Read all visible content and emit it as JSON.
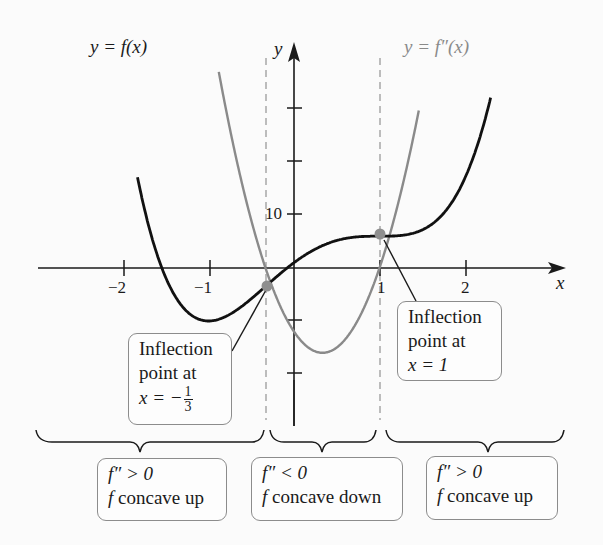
{
  "chart_data": {
    "type": "line",
    "title": "",
    "xlabel": "x",
    "ylabel": "y",
    "xlim": [
      -2.5,
      3.0
    ],
    "ylim": [
      -20,
      30
    ],
    "grid": false,
    "x_ticks": [
      -2,
      -1,
      1,
      2
    ],
    "x_tick_labels": [
      "−2",
      "−1",
      "1",
      "2"
    ],
    "y_ticks": [
      -20,
      -10,
      10,
      20,
      30
    ],
    "y_tick_labels": [
      "",
      "",
      "10",
      "",
      ""
    ],
    "series": [
      {
        "name": "y = f(x)",
        "formula": "3x^4 - 4x^3 - 6x^2 + 12x + 1",
        "color": "#111111",
        "x": [
          -1.75,
          -1.5,
          -1.25,
          -1.0,
          -0.75,
          -0.5,
          -0.333,
          0.0,
          0.25,
          0.5,
          0.75,
          1.0,
          1.25,
          1.5,
          1.75,
          2.0,
          2.3
        ],
        "values": [
          22.6,
          2.7,
          -6.6,
          -10.0,
          -9.5,
          -6.8,
          -4.4,
          1.0,
          3.6,
          5.3,
          6.1,
          6.0,
          6.2,
          7.7,
          12.0,
          17.0,
          30.0
        ]
      },
      {
        "name": "y = f''(x)",
        "formula": "36x^2 - 24x - 12",
        "color": "#8a8a8a",
        "x": [
          -0.85,
          -0.75,
          -0.5,
          -0.333,
          0.0,
          0.333,
          0.5,
          0.75,
          1.0,
          1.25,
          1.45
        ],
        "values": [
          34.4,
          26.3,
          9.0,
          0.0,
          -12.0,
          -16.0,
          -15.0,
          -9.75,
          0.0,
          14.25,
          28.9
        ]
      }
    ],
    "inflection_points": [
      {
        "x": -0.333,
        "y": -4.4,
        "label_lines": [
          "Inflection",
          "point at",
          "x = −"
        ],
        "fraction": {
          "num": "1",
          "den": "3"
        }
      },
      {
        "x": 1.0,
        "y": 6.0,
        "label_lines": [
          "Inflection",
          "point at",
          "x = 1"
        ]
      }
    ],
    "dashed_lines_x": [
      -0.333,
      1.0
    ],
    "intervals": [
      {
        "range": "x < -1/3",
        "line1": "f″ > 0",
        "line2": "concave up",
        "fn": "f"
      },
      {
        "range": "-1/3 < x < 1",
        "line1": "f″ < 0",
        "line2": "concave down",
        "fn": "f"
      },
      {
        "range": "x > 1",
        "line1": "f″ > 0",
        "line2": "concave up",
        "fn": "f"
      }
    ],
    "annotations": [
      "y = f(x)",
      "y = f″(x)"
    ]
  },
  "labels": {
    "f_curve": "y = f(x)",
    "fpp_curve": "y = f″(x)",
    "x_axis": "x",
    "y_axis": "y",
    "tick_neg2": "−2",
    "tick_neg1": "−1",
    "tick_1": "1",
    "tick_2": "2",
    "tick_10": "10",
    "infl1_l1": "Inflection",
    "infl1_l2": "point at",
    "infl1_l3": "x = −",
    "infl1_num": "1",
    "infl1_den": "3",
    "infl2_l1": "Inflection",
    "infl2_l2": "point at",
    "infl2_l3": "x = 1",
    "int1_l1": "f″ > 0",
    "int1_f": "f",
    "int1_l2": " concave up",
    "int2_l1": "f″ < 0",
    "int2_f": "f",
    "int2_l2": " concave down",
    "int3_l1": "f″ > 0",
    "int3_f": "f",
    "int3_l2": " concave up"
  },
  "colors": {
    "f_curve": "#111111",
    "fpp_curve": "#8a8a8a",
    "axis": "#1a1a1a",
    "dashed": "#9a9a9a",
    "point": "#8f8f8f",
    "box_border": "#8c8c8c"
  }
}
